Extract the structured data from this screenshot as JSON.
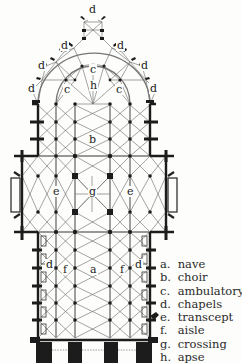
{
  "diagram": {
    "type": "cathedral floor plan",
    "colors": {
      "background": "#fdfdfb",
      "ink": "#1c1c1c",
      "thin_line": "#555555"
    },
    "plan_labels": [
      {
        "id": "d1",
        "text": "d",
        "x": 88,
        "y": 4
      },
      {
        "id": "d2",
        "text": "d",
        "x": 60,
        "y": 40
      },
      {
        "id": "d3",
        "text": "d",
        "x": 116,
        "y": 40
      },
      {
        "id": "d4",
        "text": "d",
        "x": 37,
        "y": 60
      },
      {
        "id": "d5",
        "text": "d",
        "x": 140,
        "y": 60
      },
      {
        "id": "d6",
        "text": "d",
        "x": 27,
        "y": 83
      },
      {
        "id": "d7",
        "text": "d",
        "x": 149,
        "y": 83
      },
      {
        "id": "c1",
        "text": "c",
        "x": 89,
        "y": 64
      },
      {
        "id": "c2",
        "text": "c",
        "x": 63,
        "y": 84
      },
      {
        "id": "c3",
        "text": "c",
        "x": 115,
        "y": 84
      },
      {
        "id": "h",
        "text": "h",
        "x": 89,
        "y": 80
      },
      {
        "id": "b",
        "text": "b",
        "x": 88,
        "y": 134
      },
      {
        "id": "e1",
        "text": "e",
        "x": 52,
        "y": 186
      },
      {
        "id": "g",
        "text": "g",
        "x": 88,
        "y": 186
      },
      {
        "id": "e2",
        "text": "e",
        "x": 126,
        "y": 186
      },
      {
        "id": "d8",
        "text": "d",
        "x": 45,
        "y": 259
      },
      {
        "id": "d9",
        "text": "d",
        "x": 134,
        "y": 259
      },
      {
        "id": "f1",
        "text": "f",
        "x": 62,
        "y": 264
      },
      {
        "id": "a",
        "text": "a",
        "x": 89,
        "y": 264
      },
      {
        "id": "f2",
        "text": "f",
        "x": 119,
        "y": 264
      }
    ],
    "legend": [
      {
        "key": "a.",
        "label": "nave"
      },
      {
        "key": "b.",
        "label": "choir"
      },
      {
        "key": "c.",
        "label": "ambulatory"
      },
      {
        "key": "d.",
        "label": "chapels"
      },
      {
        "key": "e.",
        "label": "transcept"
      },
      {
        "key": "f.",
        "label": "aisle"
      },
      {
        "key": "g.",
        "label": "crossing"
      },
      {
        "key": "h.",
        "label": "apse"
      }
    ]
  }
}
